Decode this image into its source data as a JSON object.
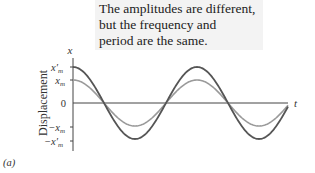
{
  "annotation": {
    "lines": [
      "The amplitudes are different,",
      "but the frequency and",
      "period are the same."
    ]
  },
  "figure_label": "(a)",
  "axes": {
    "y_axis_symbol": "x",
    "x_axis_symbol": "t",
    "y_axis_title": "Displacement",
    "y_ticks": [
      {
        "label": "x′m",
        "main": "x′",
        "sub": "m"
      },
      {
        "label": "xm",
        "main": "x",
        "sub": "m"
      },
      {
        "label": "0",
        "main": "0",
        "sub": ""
      },
      {
        "label": "−xm",
        "main": "−x",
        "sub": "m"
      },
      {
        "label": "−x′m",
        "main": "−x′",
        "sub": "m"
      }
    ]
  },
  "colors": {
    "large_amplitude_curve": "#555555",
    "small_amplitude_curve": "#9a9a9a",
    "axis": "#444444",
    "callout_bg": "#f3f3f3"
  },
  "chart_data": {
    "type": "line",
    "title": "The amplitudes are different, but the frequency and period are the same.",
    "xlabel": "t",
    "ylabel": "Displacement x",
    "series": [
      {
        "name": "x'm cos(ωt) (larger amplitude)",
        "amplitude": "x'm",
        "relative_amplitude": 1.0,
        "form": "cosine",
        "periods_shown": 1.75
      },
      {
        "name": "xm cos(ωt) (smaller amplitude)",
        "amplitude": "xm",
        "relative_amplitude": 0.64,
        "form": "cosine",
        "periods_shown": 1.75
      }
    ],
    "y_tick_labels": [
      "x'm",
      "xm",
      "0",
      "-xm",
      "-x'm"
    ],
    "grid": false
  }
}
